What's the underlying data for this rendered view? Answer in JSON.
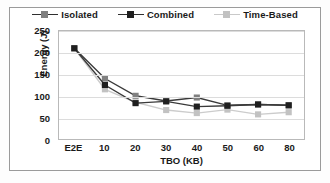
{
  "chart_data": {
    "type": "line",
    "title": "",
    "xlabel": "TBO (KB)",
    "ylabel": "Energy (J)",
    "categories": [
      "E2E",
      "10",
      "20",
      "30",
      "40",
      "50",
      "60",
      "80"
    ],
    "ylim": [
      0,
      250
    ],
    "yticks": [
      0,
      50,
      100,
      150,
      200,
      250
    ],
    "grid": true,
    "legend_position": "top",
    "series": [
      {
        "name": "Isolated",
        "color": "#808080",
        "line_color": "#3a3a3a",
        "marker": "square",
        "values": [
          210,
          140,
          100,
          88,
          96,
          78,
          80,
          78
        ]
      },
      {
        "name": "Combined",
        "color": "#1f1f1f",
        "line_color": "#3a3a3a",
        "marker": "square",
        "values": [
          210,
          125,
          83,
          87,
          75,
          77,
          80,
          78
        ]
      },
      {
        "name": "Time-Based",
        "color": "#c2c2c2",
        "line_color": "#cccccc",
        "marker": "square",
        "values": [
          210,
          115,
          85,
          67,
          60,
          68,
          57,
          62
        ]
      }
    ]
  }
}
